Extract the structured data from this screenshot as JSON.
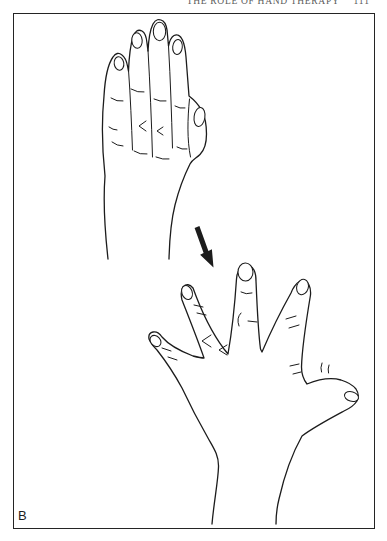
{
  "page": {
    "running_header": "THE ROLE OF HAND THERAPY",
    "page_number": "111",
    "figure_label": "B"
  },
  "figure": {
    "ink_color": "#1c1c1c",
    "paper_color": "#ffffff",
    "frame_color": "#242424",
    "header_text_color": "#5a5a5a",
    "top_panel_icon": "hand-fingers-together-illustration",
    "bottom_panel_icon": "hand-fingers-spread-illustration",
    "arrow_icon": "arrow-down-right-icon"
  }
}
